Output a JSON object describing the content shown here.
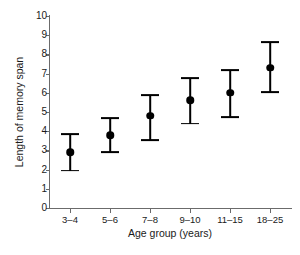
{
  "chart_data": {
    "type": "scatter",
    "title": "",
    "xlabel": "Age group (years)",
    "ylabel": "Length of memory span",
    "categories": [
      "3–4",
      "5–6",
      "7–8",
      "9–10",
      "11–15",
      "18–25"
    ],
    "values": [
      2.9,
      3.8,
      4.8,
      5.6,
      6.0,
      7.3
    ],
    "error_low": [
      1.95,
      2.9,
      3.55,
      4.4,
      4.75,
      6.05
    ],
    "error_high": [
      3.85,
      4.7,
      5.9,
      6.75,
      7.2,
      8.65
    ],
    "ylim": [
      0,
      10
    ],
    "yticks": [
      0,
      1,
      2,
      3,
      4,
      5,
      6,
      7,
      8,
      9,
      10
    ],
    "ytick_labels": [
      "0",
      "1",
      "2",
      "3",
      "4",
      "5",
      "6",
      "7",
      "8",
      "9",
      "10"
    ],
    "grid": false,
    "legend": "none",
    "marker": "filled-circle",
    "marker_color": "#000000",
    "errorbar_color": "#000000",
    "axis_color": "#6b6b6b",
    "background_color": "#ffffff"
  }
}
